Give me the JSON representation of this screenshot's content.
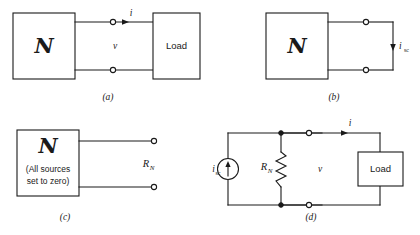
{
  "figure": {
    "stroke_color": "#1a1a1a",
    "background_color": "#ffffff"
  },
  "panels": [
    {
      "id": "a",
      "caption": "(a)",
      "network_symbol": "N",
      "network_note": "",
      "load_label": "Load",
      "current_label": "i",
      "voltage_label": "v",
      "resistor_label": "",
      "source_label": ""
    },
    {
      "id": "b",
      "caption": "(b)",
      "network_symbol": "N",
      "network_note": "",
      "load_label": "",
      "current_label": "i",
      "current_sub": "sc",
      "voltage_label": "",
      "resistor_label": "",
      "source_label": ""
    },
    {
      "id": "c",
      "caption": "(c)",
      "network_symbol": "N",
      "network_note_line1": "(All sources",
      "network_note_line2": "set to zero)",
      "load_label": "",
      "current_label": "",
      "voltage_label": "",
      "resistor_label": "R",
      "resistor_sub": "N",
      "source_label": ""
    },
    {
      "id": "d",
      "caption": "(d)",
      "network_symbol": "",
      "network_note": "",
      "load_label": "Load",
      "current_label": "i",
      "voltage_label": "v",
      "resistor_label": "R",
      "resistor_sub": "N",
      "source_label": "i",
      "source_sub": "sc"
    }
  ]
}
